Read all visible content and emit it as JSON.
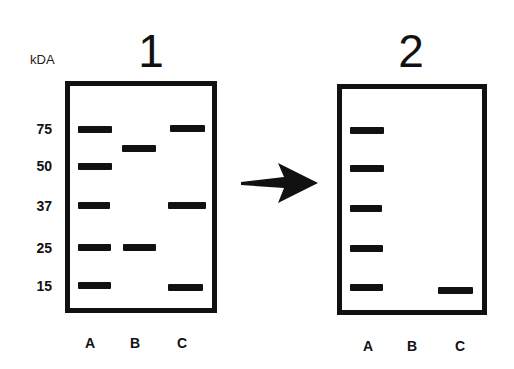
{
  "figure": {
    "unit_label": "kDA",
    "arrow": {
      "icon": "right-arrow-icon",
      "color": "#111111"
    },
    "gels": [
      {
        "title": "1",
        "markers": [
          "75",
          "50",
          "37",
          "25",
          "15"
        ],
        "lanes": [
          "A",
          "B",
          "C"
        ],
        "bands": {
          "A": [
            "75",
            "50",
            "37",
            "25",
            "15"
          ],
          "B": [
            "~60",
            "25"
          ],
          "C": [
            "75",
            "37",
            "15"
          ]
        }
      },
      {
        "title": "2",
        "lanes": [
          "A",
          "B",
          "C"
        ],
        "bands": {
          "A": [
            "75",
            "50",
            "37",
            "25",
            "15"
          ],
          "B": [],
          "C": [
            "15"
          ]
        }
      }
    ]
  }
}
